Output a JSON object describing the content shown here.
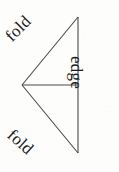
{
  "figure": {
    "background_color": "#fdfdfc",
    "line_color": "#4a4a4a",
    "text_color": "#1a1a1a",
    "width": 119,
    "height": 172,
    "labels": {
      "fold_top": "fold",
      "fold_bottom": "fold",
      "edge": "edge"
    },
    "geometry": {
      "apex_left": [
        22,
        85
      ],
      "vertex_top_right": [
        78,
        17
      ],
      "vertex_bottom_right": [
        78,
        153
      ],
      "median_line": [
        [
          22,
          85
        ],
        [
          78,
          85
        ]
      ]
    }
  }
}
